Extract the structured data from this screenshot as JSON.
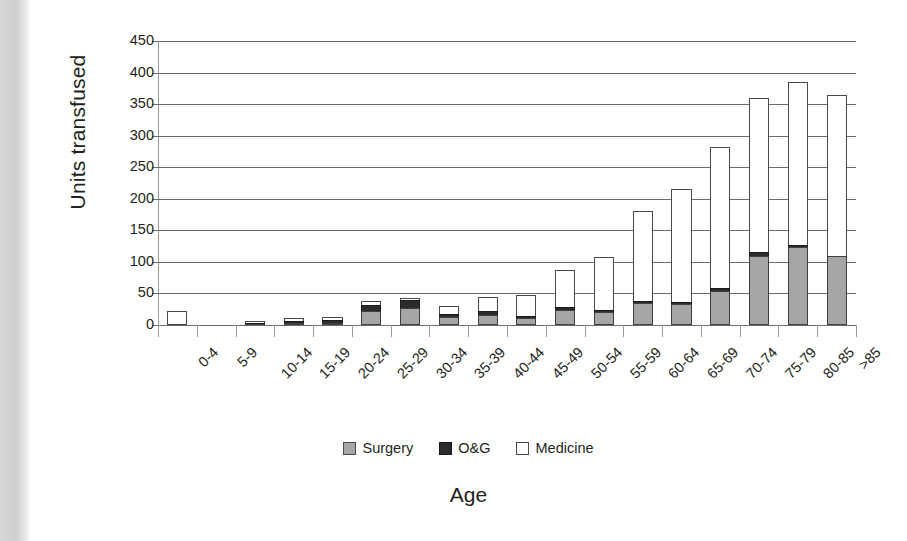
{
  "chart_data": {
    "type": "bar",
    "stacked": true,
    "title": "",
    "xlabel": "Age",
    "ylabel": "Units transfused",
    "ylim": [
      0,
      450
    ],
    "ytick_step": 50,
    "yticks": [
      450,
      400,
      350,
      300,
      250,
      200,
      150,
      100,
      50,
      0
    ],
    "grid": true,
    "legend_position": "bottom",
    "categories": [
      "0-4",
      "5-9",
      "10-14",
      "15-19",
      "20-24",
      "25-29",
      "30-34",
      "35-39",
      "40-44",
      "45-49",
      "50-54",
      "55-59",
      "60-64",
      "65-69",
      "70-74",
      "75-79",
      "80-85",
      ">85"
    ],
    "series": [
      {
        "name": "Surgery",
        "color": "#a6a6a6",
        "values": [
          0,
          0,
          0,
          1,
          3,
          22,
          27,
          12,
          16,
          11,
          24,
          21,
          35,
          33,
          54,
          110,
          123,
          110
        ]
      },
      {
        "name": "O&G",
        "color": "#2b2b2b",
        "values": [
          0,
          0,
          1,
          2,
          4,
          10,
          12,
          5,
          6,
          2,
          4,
          1,
          1,
          2,
          5,
          6,
          4,
          0
        ]
      },
      {
        "name": "Medicine",
        "color": "#ffffff",
        "values": [
          23,
          0,
          1,
          4,
          6,
          6,
          2,
          13,
          22,
          33,
          59,
          83,
          142,
          179,
          223,
          244,
          258,
          255
        ]
      }
    ],
    "totals": [
      23,
      0,
      2,
      7,
      13,
      38,
      41,
      30,
      44,
      46,
      87,
      105,
      178,
      214,
      282,
      360,
      385,
      365
    ]
  },
  "legend": {
    "items": [
      {
        "label": "Surgery",
        "swatch": "square-gray-icon"
      },
      {
        "label": "O&G",
        "swatch": "square-black-icon"
      },
      {
        "label": "Medicine",
        "swatch": "square-white-icon"
      }
    ]
  }
}
